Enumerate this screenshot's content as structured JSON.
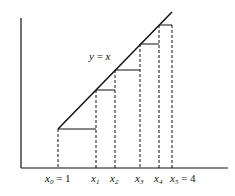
{
  "diagram": {
    "type": "step-function-under-line",
    "line_label": {
      "y": "y",
      "eq": " = ",
      "x": "x"
    },
    "x_labels": [
      {
        "base": "x",
        "sub": "0",
        "suffix": " = 1",
        "x": 45
      },
      {
        "base": "x",
        "sub": "1",
        "suffix": "",
        "x": 91
      },
      {
        "base": "x",
        "sub": "2",
        "suffix": "",
        "x": 110
      },
      {
        "base": "x",
        "sub": "3",
        "suffix": "",
        "x": 135
      },
      {
        "base": "x",
        "sub": "4",
        "suffix": "",
        "x": 154
      },
      {
        "base": "x",
        "sub": "5",
        "suffix": " = 4",
        "x": 170
      }
    ],
    "partition_x": [
      58,
      96,
      115,
      140,
      159,
      172
    ],
    "step_y": [
      129,
      90,
      70,
      44,
      25
    ],
    "axis": {
      "origin_x": 21,
      "axis_y": 168,
      "top_y": 18,
      "right_x": 228
    },
    "line": {
      "x1": 58,
      "y1": 129,
      "x2": 172,
      "y2": 12
    },
    "colors": {
      "stroke": "#111111",
      "background": "#ffffff"
    }
  }
}
